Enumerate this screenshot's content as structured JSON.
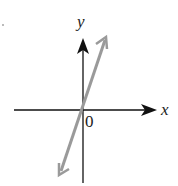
{
  "diagram": {
    "type": "coordinate-plane-line",
    "axes": {
      "x_label": "x",
      "y_label": "y",
      "origin_label": "0"
    },
    "line": {
      "description": "straight line through origin with steep positive slope",
      "color": "#9a9a9a",
      "arrows": "both ends"
    },
    "colors": {
      "axis": "#111111",
      "line": "#9a9a9a",
      "background": "#ffffff"
    }
  }
}
